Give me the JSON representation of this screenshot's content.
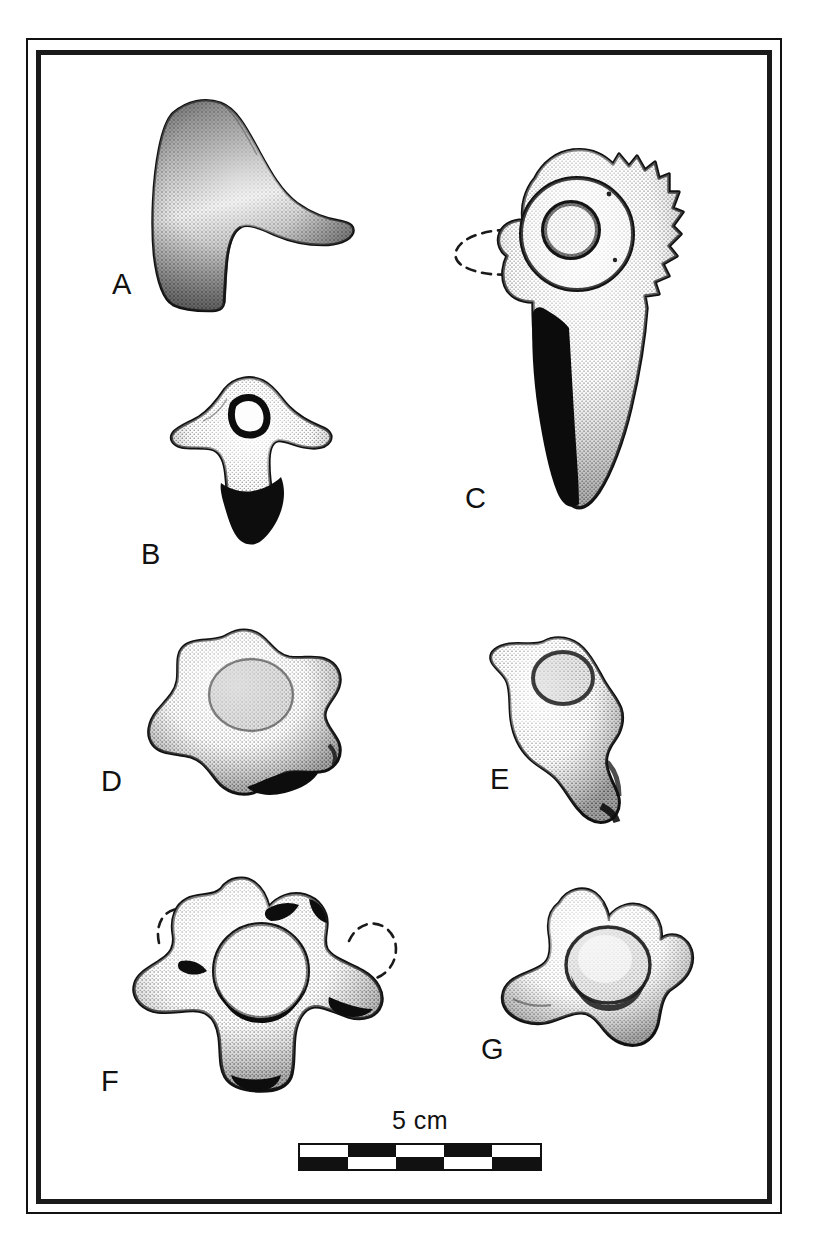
{
  "figure": {
    "kind": "paleontological-plate",
    "background_color": "#ffffff",
    "ink_color": "#111111",
    "frame": {
      "outer_line_width_px": 2,
      "inner_line_width_px": 5,
      "style": "double-rule-rectangle"
    }
  },
  "specimens": [
    {
      "id": "A",
      "label": "A",
      "description": "Triangular fin-shaped skeletal element (neural spine) in lateral view, stippled shading, broad apex tapering to a pointed posterior tip",
      "view": "lateral",
      "shading": "stipple",
      "has_dashed_reconstruction": false,
      "has_solid_black_region": false
    },
    {
      "id": "B",
      "label": "B",
      "description": "Vertebra with wing-like transverse processes, small circular neural canal, solid black ventral centrum",
      "view": "anterior",
      "shading": "stipple-with-solid-black",
      "has_dashed_reconstruction": false,
      "has_solid_black_region": true
    },
    {
      "id": "C",
      "label": "C",
      "description": "Large vertebra with serrated toothed dorsal crest, prominent concentric ring-shaped articular facet, solid black ventral blade, dashed reconstructed anterior process",
      "view": "lateral",
      "shading": "stipple-with-solid-black",
      "has_dashed_reconstruction": true,
      "has_solid_black_region": true
    },
    {
      "id": "D",
      "label": "D",
      "description": "Rounded lobate vertebral centrum with shallow central depression and irregular marginal lobes, stippled",
      "view": "articular",
      "shading": "stipple",
      "has_dashed_reconstruction": false,
      "has_solid_black_region": true
    },
    {
      "id": "E",
      "label": "E",
      "description": "Elongate irregular bone fragment with a circular facet at the upper end, narrowing to a sinuous shaft",
      "view": "oblique",
      "shading": "stipple",
      "has_dashed_reconstruction": false,
      "has_solid_black_region": true
    },
    {
      "id": "F",
      "label": "F",
      "description": "Vertebra in anterior view with prominent round central cotyle, paired lateral and dorsal processes, two dashed reconstructed process outlines flanking the dorsal processes",
      "view": "anterior",
      "shading": "stipple-with-solid-black",
      "has_dashed_reconstruction": true,
      "has_solid_black_region": true
    },
    {
      "id": "G",
      "label": "G",
      "description": "Vertebra with round central cotyle, elongate left transverse process and lobed dorsal processes, stippled",
      "view": "anterior",
      "shading": "stipple",
      "has_dashed_reconstruction": false,
      "has_solid_black_region": false
    }
  ],
  "scale_bar": {
    "caption": "5 cm",
    "total_length_label": "5 cm",
    "segments": 5,
    "rows": 2,
    "pattern": "checkerboard",
    "top_row_first_cell": "white",
    "bottom_row_first_cell": "black",
    "top_row": [
      "white",
      "black",
      "white",
      "black",
      "white"
    ],
    "bottom_row": [
      "black",
      "white",
      "black",
      "white",
      "black"
    ],
    "border_color": "#111111"
  }
}
